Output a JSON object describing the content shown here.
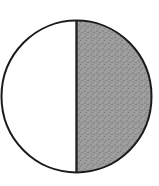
{
  "figure": {
    "shaded_fraction": "1/2",
    "shaded_side": "right",
    "colors": {
      "background": "#ffffff",
      "outline": "#1b1b1b",
      "divider": "#222222",
      "unshaded_fill": "#ffffff",
      "shaded_base": "#9c9c9c",
      "speckle_dark": "#757575",
      "speckle_darker": "#666666",
      "speckle_light": "#b2b2b2"
    }
  }
}
